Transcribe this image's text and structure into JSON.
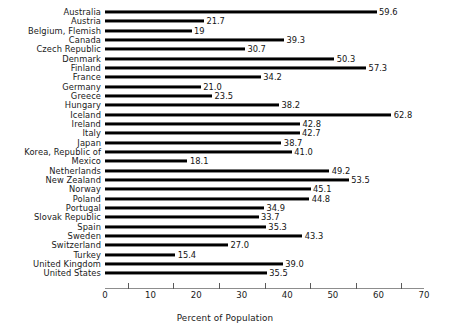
{
  "chart_data": {
    "type": "bar",
    "orientation": "horizontal",
    "title": "",
    "xlabel": "Percent of Population",
    "ylabel": "",
    "xlim": [
      0,
      70
    ],
    "xticks": [
      0,
      10,
      20,
      30,
      40,
      50,
      60,
      70
    ],
    "xminorticks": [
      5,
      15,
      25,
      35,
      45,
      55,
      65
    ],
    "grid": false,
    "legend": null,
    "bar_color": "#000000",
    "axis_color": "#8d8d8d",
    "categories": [
      "Australia",
      "Austria",
      "Belgium, Flemish",
      "Canada",
      "Czech Republic",
      "Denmark",
      "Finland",
      "France",
      "Germany",
      "Greece",
      "Hungary",
      "Iceland",
      "Ireland",
      "Italy",
      "Japan",
      "Korea, Republic of",
      "Mexico",
      "Netherlands",
      "New Zealand",
      "Norway",
      "Poland",
      "Portugal",
      "Slovak Republic",
      "Spain",
      "Sweden",
      "Switzerland",
      "Turkey",
      "United Kingdom",
      "United States"
    ],
    "values": [
      59.6,
      21.7,
      19,
      39.3,
      30.7,
      50.3,
      57.3,
      34.2,
      21.0,
      23.5,
      38.2,
      62.8,
      42.8,
      42.7,
      38.7,
      41.0,
      18.1,
      49.2,
      53.5,
      45.1,
      44.8,
      34.9,
      33.7,
      35.3,
      43.3,
      27.0,
      15.4,
      39.0,
      35.5
    ],
    "value_labels": [
      "59.6",
      "21.7",
      "19",
      "39.3",
      "30.7",
      "50.3",
      "57.3",
      "34.2",
      "21.0",
      "23.5",
      "38.2",
      "62.8",
      "42.8",
      "42.7",
      "38.7",
      "41.0",
      "18.1",
      "49.2",
      "53.5",
      "45.1",
      "44.8",
      "34.9",
      "33.7",
      "35.3",
      "43.3",
      "27.0",
      "15.4",
      "39.0",
      "35.5"
    ]
  }
}
